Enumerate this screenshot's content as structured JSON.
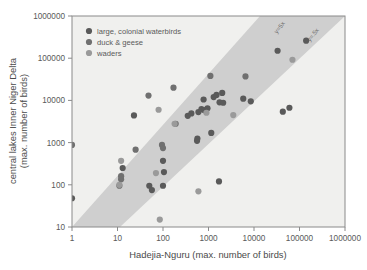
{
  "chart_data": {
    "type": "scatter",
    "title": "",
    "xlabel": "Hadejia-Nguru (max. number of birds)",
    "ylabel": "central lakes Inner Niger Delta\n(max. number of birds)",
    "ylabel_line1": "central lakes Inner Niger Delta",
    "ylabel_line2": "(max. number of birds)",
    "xscale": "log",
    "yscale": "log",
    "xlim": [
      1,
      1000000
    ],
    "ylim": [
      10,
      1000000
    ],
    "grid": false,
    "legend_position": "top-left",
    "xticks": [
      1,
      10,
      100,
      1000,
      10000,
      100000,
      1000000
    ],
    "xtick_labels": [
      "1",
      "10",
      "100",
      "1000",
      "10000",
      "100000",
      "1000000"
    ],
    "yticks": [
      10,
      100,
      1000,
      10000,
      100000,
      1000000
    ],
    "ytick_labels": [
      "10",
      "100",
      "1000",
      "10000",
      "100000",
      "1000000"
    ],
    "annotations": [
      {
        "text": "y=5x",
        "position": "upper-band-edge",
        "rotated": true
      },
      {
        "text": "y=.5x",
        "position": "lower-band-edge",
        "rotated": true
      }
    ],
    "band": {
      "description": "shaded ratio band between y=5x and y=.5x",
      "upper_slope_factor": 5,
      "lower_slope_factor": 0.5,
      "color": "#c9c9c9"
    },
    "series": [
      {
        "name": "large, colonial waterbirds",
        "color": "#5a5a5a",
        "points": [
          [
            1,
            48
          ],
          [
            23,
            4400
          ],
          [
            13,
            250
          ],
          [
            50,
            95
          ],
          [
            57,
            75
          ],
          [
            100,
            370
          ],
          [
            105,
            200
          ],
          [
            100,
            95
          ],
          [
            350,
            4300
          ],
          [
            420,
            4900
          ],
          [
            560,
            1100
          ],
          [
            570,
            1250
          ],
          [
            600,
            5300
          ],
          [
            700,
            6200
          ],
          [
            780,
            10500
          ],
          [
            800,
            5900
          ],
          [
            950,
            6500
          ],
          [
            1150,
            1700
          ],
          [
            1300,
            12000
          ],
          [
            1500,
            13500
          ],
          [
            1700,
            120
          ],
          [
            1750,
            9000
          ],
          [
            2000,
            15000
          ],
          [
            2100,
            8800
          ],
          [
            5800,
            11000
          ],
          [
            8500,
            9500
          ],
          [
            33000,
            150000
          ],
          [
            43000,
            5400
          ],
          [
            60000,
            6700
          ],
          [
            140000,
            260000
          ]
        ]
      },
      {
        "name": "duck & geese",
        "color": "#707070",
        "points": [
          [
            1,
            880
          ],
          [
            11,
            95
          ],
          [
            12,
            135
          ],
          [
            12,
            160
          ],
          [
            25,
            680
          ],
          [
            48,
            13000
          ],
          [
            95,
            880
          ],
          [
            100,
            740
          ],
          [
            170,
            20000
          ],
          [
            190,
            2800
          ],
          [
            1100,
            38000
          ],
          [
            6500,
            37000
          ]
        ]
      },
      {
        "name": "waders",
        "color": "#9a9a9a",
        "points": [
          [
            11,
            100
          ],
          [
            12,
            370
          ],
          [
            70,
            190
          ],
          [
            80,
            6000
          ],
          [
            85,
            15
          ],
          [
            180,
            2800
          ],
          [
            600,
            70
          ],
          [
            900,
            5100
          ],
          [
            3500,
            4500
          ],
          [
            70000,
            92000
          ]
        ]
      }
    ]
  },
  "legend": {
    "items": [
      {
        "label": "large, colonial waterbirds",
        "color": "#5a5a5a"
      },
      {
        "label": "duck & geese",
        "color": "#707070"
      },
      {
        "label": "waders",
        "color": "#9a9a9a"
      }
    ]
  },
  "axes": {
    "x_title": "Hadejia-Nguru (max. number of birds)",
    "y_title_line1": "central lakes Inner Niger Delta",
    "y_title_line2": "(max. number of birds)"
  },
  "colors": {
    "plot_background": "#f0f0ee",
    "frame": "#8a8a8a",
    "band": "#c9c9c9",
    "text": "#4d4d4d"
  }
}
